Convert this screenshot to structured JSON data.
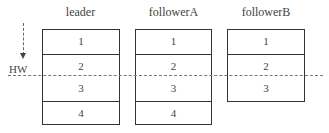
{
  "logs": [
    {
      "name": "leader",
      "entries": [
        "1",
        "2",
        "3",
        "4"
      ]
    },
    {
      "name": "followerA",
      "entries": [
        "1",
        "2",
        "3",
        "4"
      ]
    },
    {
      "name": "followerB",
      "entries": [
        "1",
        "2",
        "3"
      ]
    }
  ],
  "marker": {
    "label": "HW"
  }
}
